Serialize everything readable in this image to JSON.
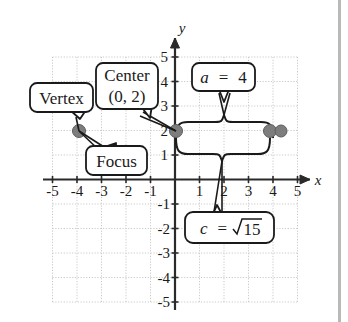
{
  "figure": {
    "type": "coordinate-plane-diagram",
    "axes": {
      "x_label": "x",
      "y_label": "y",
      "x_ticks": [
        "-5",
        "-4",
        "-3",
        "-2",
        "-1",
        "1",
        "2",
        "3",
        "4",
        "5"
      ],
      "y_ticks": [
        "5",
        "4",
        "3",
        "2",
        "1",
        "-1",
        "-2",
        "-3",
        "-4",
        "-5"
      ],
      "x_range": [
        -5,
        5
      ],
      "y_range": [
        -5,
        5
      ],
      "grid": "dotted"
    },
    "callouts": [
      {
        "id": "vertex",
        "label": "Vertex"
      },
      {
        "id": "center",
        "label_line1": "Center",
        "label_line2": "(0, 2)"
      },
      {
        "id": "focus",
        "label": "Focus"
      },
      {
        "id": "a",
        "lhs": "a",
        "eq": "=",
        "rhs": "4"
      },
      {
        "id": "c",
        "lhs": "c",
        "eq": "=",
        "radicand": "15"
      }
    ],
    "points": [
      {
        "name": "left-vertex-focus",
        "x": -4,
        "y": 2
      },
      {
        "name": "center",
        "x": 0,
        "y": 2
      },
      {
        "name": "right-focus",
        "x": 3.873,
        "y": 2
      },
      {
        "name": "right-vertex",
        "x": 4,
        "y": 2
      }
    ],
    "braces": [
      {
        "name": "a-brace",
        "from_x": 0,
        "to_x": 4,
        "measure": "a = 4"
      },
      {
        "name": "c-brace",
        "from_x": 0,
        "to_x": 3.873,
        "measure": "c = sqrt(15)"
      }
    ],
    "colors": {
      "grid": "#c9c9c9",
      "axis": "#2a2a2a",
      "point": "#7d7d7d",
      "callout_border": "#1a1a1a",
      "callout_fill": "#ffffff",
      "page_rule": "#b9b9b9"
    }
  }
}
